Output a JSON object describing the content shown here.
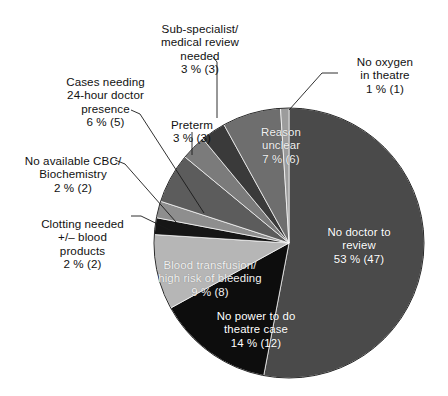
{
  "figure": {
    "type": "pie-chart",
    "background": "#ffffff",
    "center_x": 289,
    "center_y": 243,
    "radius": 135,
    "start_angle_deg": 0,
    "direction": "clockwise"
  },
  "chart_data": {
    "type": "pie",
    "title": "",
    "xlabel": "",
    "ylabel": "",
    "total_count": 89,
    "units": "percent",
    "legend_position": "callouts",
    "grid": false,
    "categories": [
      "No doctor to review",
      "No power to do theatre case",
      "Blood transfusion/ high risk of bleeding",
      "Clotting needed +/- blood products",
      "No available CBC/ Biochemistry",
      "Cases needing 24-hour doctor presence",
      "Preterm",
      "Sub-specialist/ medical review needed",
      "Reason unclear",
      "No oxygen in theatre"
    ],
    "values": [
      53,
      14,
      9,
      2,
      2,
      6,
      3,
      3,
      7,
      1
    ],
    "counts": [
      47,
      12,
      8,
      2,
      2,
      5,
      3,
      3,
      6,
      1
    ],
    "colors": [
      "#4a4a4a",
      "#0d0d0d",
      "#b6b6b6",
      "#161616",
      "#8e8e8e",
      "#5c5c5c",
      "#7b7b7b",
      "#3a3a3a",
      "#6e6e6e",
      "#9c9c9c"
    ]
  },
  "slices": [
    {
      "name": "no-doctor-to-review",
      "label": "No doctor to\nreview",
      "value_text": "53 %  (47)",
      "percent": 53,
      "count": 47,
      "color": "#4a4a4a",
      "label_placement": "inside"
    },
    {
      "name": "no-power-theatre-case",
      "label": "No power to do\ntheatre case",
      "value_text": "14 %  (12)",
      "percent": 14,
      "count": 12,
      "color": "#0d0d0d",
      "label_placement": "inside"
    },
    {
      "name": "blood-transfusion-high-risk-bleeding",
      "label": "Blood transfusion/\nhigh risk of bleeding",
      "value_text": "9 %  (8)",
      "percent": 9,
      "count": 8,
      "color": "#b6b6b6",
      "label_placement": "inside"
    },
    {
      "name": "clotting-needed-blood-products",
      "label": "Clotting needed\n+/– blood\nproducts",
      "value_text": "2 %  (2)",
      "percent": 2,
      "count": 2,
      "color": "#161616",
      "label_placement": "callout-left"
    },
    {
      "name": "no-available-cbc-biochemistry",
      "label": "No available CBC/\nBiochemistry",
      "value_text": "2 %  (2)",
      "percent": 2,
      "count": 2,
      "color": "#8e8e8e",
      "label_placement": "callout-left"
    },
    {
      "name": "cases-needing-24-hour-doctor-presence",
      "label": "Cases needing\n24-hour doctor\npresence",
      "value_text": "6 %  (5)",
      "percent": 6,
      "count": 5,
      "color": "#5c5c5c",
      "label_placement": "callout-left"
    },
    {
      "name": "preterm",
      "label": "Preterm",
      "value_text": "3 %  (3)",
      "percent": 3,
      "count": 3,
      "color": "#7b7b7b",
      "label_placement": "callout-top"
    },
    {
      "name": "sub-specialist-medical-review-needed",
      "label": "Sub-specialist/\nmedical review\nneeded",
      "value_text": "3 %  (3)",
      "percent": 3,
      "count": 3,
      "color": "#3a3a3a",
      "label_placement": "callout-top"
    },
    {
      "name": "reason-unclear",
      "label": "Reason\nunclear",
      "value_text": "7 %  (6)",
      "percent": 7,
      "count": 6,
      "color": "#6e6e6e",
      "label_placement": "inside"
    },
    {
      "name": "no-oxygen-in-theatre",
      "label": "No oxygen\nin theatre",
      "value_text": "1 %  (1)",
      "percent": 1,
      "count": 1,
      "color": "#9c9c9c",
      "label_placement": "callout-right"
    }
  ]
}
